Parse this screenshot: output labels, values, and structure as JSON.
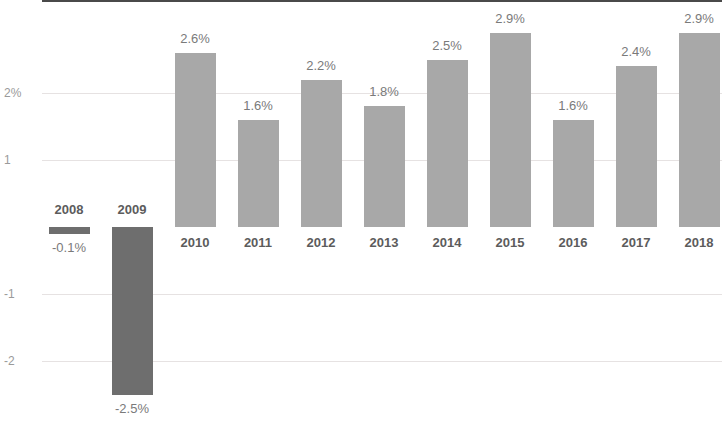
{
  "chart_data": {
    "type": "bar",
    "title": "",
    "subtitle": "",
    "xlabel": "",
    "ylabel": "",
    "categories": [
      "2008",
      "2009",
      "2010",
      "2011",
      "2012",
      "2013",
      "2014",
      "2015",
      "2016",
      "2017",
      "2018"
    ],
    "values": [
      -0.1,
      -2.5,
      2.6,
      1.6,
      2.2,
      1.8,
      2.5,
      2.9,
      1.6,
      2.4,
      2.9
    ],
    "data_labels": [
      "-0.1%",
      "-2.5%",
      "2.6%",
      "1.6%",
      "2.2%",
      "1.8%",
      "2.5%",
      "2.9%",
      "1.6%",
      "2.4%",
      "2.9%"
    ],
    "y_ticks": [
      2,
      1,
      -1,
      -2
    ],
    "y_tick_labels": [
      "2%",
      "1",
      "-1",
      "-2"
    ],
    "ylim": [
      -2.6,
      3.1
    ],
    "grid": true,
    "legend": "none",
    "colors": {
      "positive_bar": "#a8a8a8",
      "negative_bar": "#6e6e6e",
      "gridline": "#e6e2e2",
      "axis": "#4a4a4a",
      "value_label": "#7a7a7a",
      "category_label": "#5c5c5c",
      "tick_label": "#9a9a9a",
      "background": "#ffffff"
    }
  }
}
